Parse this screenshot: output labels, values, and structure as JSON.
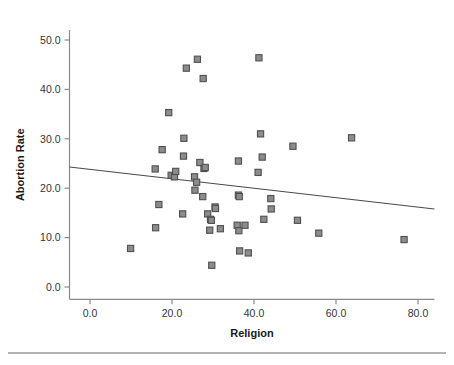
{
  "chart_data": {
    "type": "scatter",
    "title": "",
    "xlabel": "Religion",
    "ylabel": "Abortion Rate",
    "xlim": [
      -5.0,
      84.0
    ],
    "ylim": [
      -2.5,
      52.0
    ],
    "xticks": [
      "0.0",
      "20.0",
      "40.0",
      "60.0",
      "80.0"
    ],
    "xtick_values": [
      0,
      20,
      40,
      60,
      80
    ],
    "yticks": [
      "0.0",
      "10.0",
      "20.0",
      "30.0",
      "40.0",
      "50.0"
    ],
    "ytick_values": [
      0,
      10,
      20,
      30,
      40,
      50
    ],
    "grid": false,
    "legend": null,
    "marker_shape": "square",
    "marker_color": "#8c8c8c",
    "marker_edge_color": "#4f4f4f",
    "points": [
      {
        "x": 9.9,
        "y": 7.8
      },
      {
        "x": 16.0,
        "y": 12.0
      },
      {
        "x": 16.8,
        "y": 16.7
      },
      {
        "x": 15.9,
        "y": 23.9
      },
      {
        "x": 17.6,
        "y": 27.8
      },
      {
        "x": 19.2,
        "y": 35.3
      },
      {
        "x": 19.8,
        "y": 22.6
      },
      {
        "x": 20.6,
        "y": 22.3
      },
      {
        "x": 20.9,
        "y": 23.4
      },
      {
        "x": 22.6,
        "y": 14.8
      },
      {
        "x": 22.9,
        "y": 30.1
      },
      {
        "x": 22.8,
        "y": 26.5
      },
      {
        "x": 23.5,
        "y": 44.3
      },
      {
        "x": 25.5,
        "y": 22.3
      },
      {
        "x": 25.6,
        "y": 19.6
      },
      {
        "x": 26.0,
        "y": 21.2
      },
      {
        "x": 26.2,
        "y": 46.1
      },
      {
        "x": 26.8,
        "y": 25.2
      },
      {
        "x": 27.6,
        "y": 42.2
      },
      {
        "x": 27.5,
        "y": 18.3
      },
      {
        "x": 27.8,
        "y": 24.0
      },
      {
        "x": 28.1,
        "y": 24.2
      },
      {
        "x": 28.7,
        "y": 14.8
      },
      {
        "x": 29.2,
        "y": 11.5
      },
      {
        "x": 29.4,
        "y": 13.7
      },
      {
        "x": 29.6,
        "y": 13.5
      },
      {
        "x": 29.7,
        "y": 4.4
      },
      {
        "x": 30.5,
        "y": 16.2
      },
      {
        "x": 30.6,
        "y": 15.9
      },
      {
        "x": 31.8,
        "y": 11.8
      },
      {
        "x": 35.9,
        "y": 12.5
      },
      {
        "x": 36.2,
        "y": 18.6
      },
      {
        "x": 36.4,
        "y": 18.3
      },
      {
        "x": 36.3,
        "y": 11.4
      },
      {
        "x": 36.2,
        "y": 25.5
      },
      {
        "x": 36.5,
        "y": 7.3
      },
      {
        "x": 37.8,
        "y": 12.5
      },
      {
        "x": 38.6,
        "y": 6.9
      },
      {
        "x": 41.0,
        "y": 23.2
      },
      {
        "x": 41.2,
        "y": 46.4
      },
      {
        "x": 41.6,
        "y": 31.0
      },
      {
        "x": 42.0,
        "y": 26.3
      },
      {
        "x": 42.4,
        "y": 13.7
      },
      {
        "x": 44.1,
        "y": 17.9
      },
      {
        "x": 44.2,
        "y": 15.8
      },
      {
        "x": 49.5,
        "y": 28.5
      },
      {
        "x": 50.6,
        "y": 13.5
      },
      {
        "x": 55.8,
        "y": 10.9
      },
      {
        "x": 63.8,
        "y": 30.2
      },
      {
        "x": 76.6,
        "y": 9.6
      }
    ],
    "fit_line": {
      "type": "linear-regression",
      "x_start": -5.0,
      "y_start": 24.3,
      "x_end": 84.0,
      "y_end": 15.8
    }
  },
  "figure": {
    "has_footer_rule": true
  }
}
